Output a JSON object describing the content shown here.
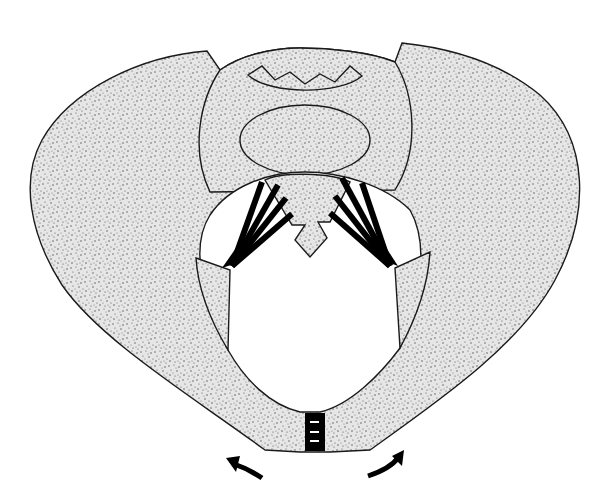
{
  "figure": {
    "style": "stippled line illustration",
    "colors": {
      "background": "#ffffff",
      "bone_fill": "#e4e4e4",
      "stipple": "#4a4a4a",
      "outline": "#1a1a1a",
      "ligament": "#000000"
    },
    "parts": [
      {
        "name": "left-ilium",
        "label": ""
      },
      {
        "name": "right-ilium",
        "label": ""
      },
      {
        "name": "sacrum",
        "label": ""
      },
      {
        "name": "vertebral-body",
        "label": ""
      },
      {
        "name": "coccyx",
        "label": ""
      },
      {
        "name": "left-sacroiliac-ligaments",
        "label": ""
      },
      {
        "name": "right-sacroiliac-ligaments",
        "label": ""
      },
      {
        "name": "pubic-symphysis",
        "label": ""
      },
      {
        "name": "left-rotation-arrow",
        "label": ""
      },
      {
        "name": "right-rotation-arrow",
        "label": ""
      }
    ]
  }
}
